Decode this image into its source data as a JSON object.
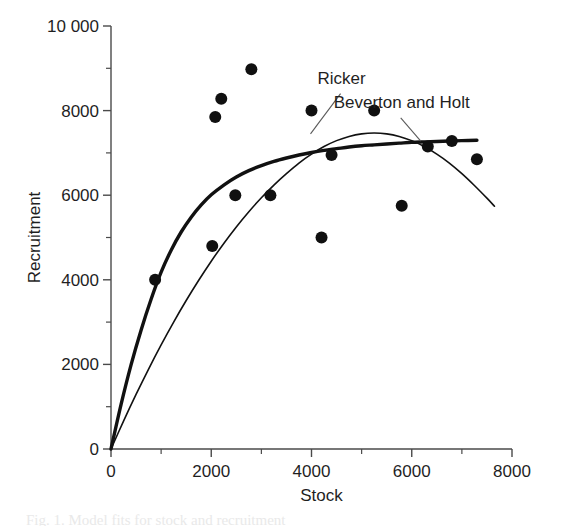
{
  "chart_data": {
    "type": "scatter",
    "title": "",
    "xlabel": "Stock",
    "ylabel": "Recruitment",
    "xlim": [
      0,
      8000
    ],
    "ylim": [
      0,
      10000
    ],
    "grid": false,
    "legend_position": "inline-annotation",
    "xticks": [
      0,
      2000,
      4000,
      6000,
      8000
    ],
    "xtick_labels": [
      "0",
      "2000",
      "4000",
      "6000",
      "8000"
    ],
    "x_minor_ticks": [
      1000,
      3000,
      5000,
      7000
    ],
    "yticks": [
      0,
      2000,
      4000,
      6000,
      8000,
      10000
    ],
    "ytick_labels": [
      "0",
      "2000",
      "4000",
      "6000",
      "8000",
      "10 000"
    ],
    "y_minor_ticks": [
      1000,
      3000,
      5000,
      7000,
      9000
    ],
    "points": [
      {
        "x": 880,
        "y": 4000
      },
      {
        "x": 2020,
        "y": 4800
      },
      {
        "x": 2080,
        "y": 7850
      },
      {
        "x": 2200,
        "y": 8280
      },
      {
        "x": 2480,
        "y": 6000
      },
      {
        "x": 2800,
        "y": 8980
      },
      {
        "x": 3180,
        "y": 6000
      },
      {
        "x": 4000,
        "y": 8000
      },
      {
        "x": 4200,
        "y": 5000
      },
      {
        "x": 4400,
        "y": 6950
      },
      {
        "x": 5250,
        "y": 8000
      },
      {
        "x": 5800,
        "y": 5750
      },
      {
        "x": 6320,
        "y": 7150
      },
      {
        "x": 6800,
        "y": 7280
      },
      {
        "x": 7300,
        "y": 6850
      }
    ],
    "series": [
      {
        "name": "Ricker",
        "kind": "line",
        "style": "thin",
        "label": "Ricker",
        "label_point": {
          "x": 4600,
          "y": 8620
        },
        "leader": {
          "x1": 4580,
          "y1": 8400,
          "x2": 3980,
          "y2": 7450
        },
        "points": [
          {
            "x": 0,
            "y": 0
          },
          {
            "x": 250,
            "y": 660
          },
          {
            "x": 500,
            "y": 1290
          },
          {
            "x": 750,
            "y": 1890
          },
          {
            "x": 1000,
            "y": 2460
          },
          {
            "x": 1250,
            "y": 3000
          },
          {
            "x": 1500,
            "y": 3510
          },
          {
            "x": 1750,
            "y": 3990
          },
          {
            "x": 2000,
            "y": 4440
          },
          {
            "x": 2250,
            "y": 4860
          },
          {
            "x": 2500,
            "y": 5250
          },
          {
            "x": 2750,
            "y": 5610
          },
          {
            "x": 3000,
            "y": 5940
          },
          {
            "x": 3250,
            "y": 6240
          },
          {
            "x": 3500,
            "y": 6510
          },
          {
            "x": 3750,
            "y": 6760
          },
          {
            "x": 4000,
            "y": 6970
          },
          {
            "x": 4250,
            "y": 7150
          },
          {
            "x": 4500,
            "y": 7290
          },
          {
            "x": 4750,
            "y": 7390
          },
          {
            "x": 5000,
            "y": 7450
          },
          {
            "x": 5250,
            "y": 7470
          },
          {
            "x": 5500,
            "y": 7450
          },
          {
            "x": 5750,
            "y": 7390
          },
          {
            "x": 6000,
            "y": 7290
          },
          {
            "x": 6250,
            "y": 7150
          },
          {
            "x": 6500,
            "y": 6970
          },
          {
            "x": 6750,
            "y": 6760
          },
          {
            "x": 7000,
            "y": 6510
          },
          {
            "x": 7250,
            "y": 6230
          },
          {
            "x": 7500,
            "y": 5930
          },
          {
            "x": 7650,
            "y": 5740
          }
        ]
      },
      {
        "name": "Beverton and Holt",
        "kind": "line",
        "style": "thick",
        "label": "Beverton and Holt",
        "label_point": {
          "x": 5800,
          "y": 8050
        },
        "leader": {
          "x1": 5780,
          "y1": 7830,
          "x2": 6180,
          "y2": 7280
        },
        "points": [
          {
            "x": 0,
            "y": 0
          },
          {
            "x": 200,
            "y": 1050
          },
          {
            "x": 400,
            "y": 1990
          },
          {
            "x": 600,
            "y": 2810
          },
          {
            "x": 800,
            "y": 3540
          },
          {
            "x": 1000,
            "y": 4180
          },
          {
            "x": 1200,
            "y": 4700
          },
          {
            "x": 1400,
            "y": 5130
          },
          {
            "x": 1600,
            "y": 5480
          },
          {
            "x": 1800,
            "y": 5770
          },
          {
            "x": 2000,
            "y": 6010
          },
          {
            "x": 2250,
            "y": 6240
          },
          {
            "x": 2500,
            "y": 6430
          },
          {
            "x": 2750,
            "y": 6580
          },
          {
            "x": 3000,
            "y": 6700
          },
          {
            "x": 3250,
            "y": 6800
          },
          {
            "x": 3500,
            "y": 6880
          },
          {
            "x": 3750,
            "y": 6950
          },
          {
            "x": 4000,
            "y": 7010
          },
          {
            "x": 4250,
            "y": 7060
          },
          {
            "x": 4500,
            "y": 7100
          },
          {
            "x": 4750,
            "y": 7140
          },
          {
            "x": 5000,
            "y": 7170
          },
          {
            "x": 5250,
            "y": 7190
          },
          {
            "x": 5500,
            "y": 7210
          },
          {
            "x": 5750,
            "y": 7230
          },
          {
            "x": 6000,
            "y": 7250
          },
          {
            "x": 6250,
            "y": 7260
          },
          {
            "x": 6500,
            "y": 7270
          },
          {
            "x": 6750,
            "y": 7280
          },
          {
            "x": 7000,
            "y": 7290
          },
          {
            "x": 7300,
            "y": 7300
          }
        ]
      }
    ],
    "marker": {
      "shape": "circle",
      "radius": 6,
      "color": "#101010"
    },
    "colors": {
      "ink": "#111111",
      "axis": "#4a4a4a",
      "background": "#ffffff"
    }
  },
  "caption": {
    "partial_text": "Fig. 1. Model fits for stock and recruitment"
  }
}
